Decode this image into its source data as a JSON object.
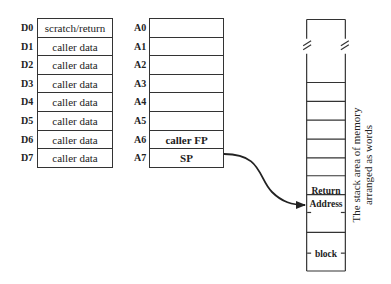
{
  "data_registers": [
    {
      "name": "D0",
      "value": "scratch/return"
    },
    {
      "name": "D1",
      "value": "caller data"
    },
    {
      "name": "D2",
      "value": "caller data"
    },
    {
      "name": "D3",
      "value": "caller data"
    },
    {
      "name": "D4",
      "value": "caller data"
    },
    {
      "name": "D5",
      "value": "caller data"
    },
    {
      "name": "D6",
      "value": "caller data"
    },
    {
      "name": "D7",
      "value": "caller data"
    }
  ],
  "address_registers": [
    {
      "name": "A0",
      "value": ""
    },
    {
      "name": "A1",
      "value": ""
    },
    {
      "name": "A2",
      "value": ""
    },
    {
      "name": "A3",
      "value": ""
    },
    {
      "name": "A4",
      "value": ""
    },
    {
      "name": "A5",
      "value": ""
    },
    {
      "name": "A6",
      "value": "caller FP"
    },
    {
      "name": "A7",
      "value": "SP"
    }
  ],
  "stack": {
    "return_label_1": "Return",
    "return_label_2": "Address",
    "block_label": "block",
    "caption_line1": "The stack area of memory",
    "caption_line2": "arranged as words"
  }
}
